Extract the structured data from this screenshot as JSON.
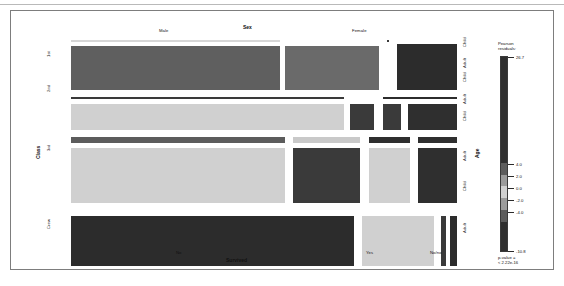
{
  "figure": {
    "type": "mosaic-plot",
    "dataset": "Titanic",
    "caption": ""
  },
  "axes": {
    "top": {
      "title": "Sex",
      "categories": [
        "Male",
        "Female"
      ]
    },
    "bottom": {
      "title": "Survived",
      "categories": [
        "No",
        "Yes",
        "No/no"
      ]
    },
    "left": {
      "title": "Class",
      "categories": [
        "1st",
        "2nd",
        "3rd",
        "Crew"
      ]
    },
    "right": {
      "title": "Age",
      "categories": [
        "Child",
        "Adult",
        "Child",
        "Adult",
        "Child",
        "Adult",
        "Child",
        "Adult"
      ]
    }
  },
  "legend": {
    "title_line1": "Pearson",
    "title_line2": "residuals:",
    "max_label": "26.7",
    "min_label": "-10.8",
    "breaks": [
      "4.0",
      "2.0",
      "0.0",
      "-2.0",
      "-4.0"
    ],
    "pvalue_line1": "p-value =",
    "pvalue_line2": "< 2.22e-16",
    "colors": {
      "very_high": "#2f2f2f",
      "high": "#5c5c5c",
      "mid_high": "#9b9b9b",
      "neutral": "#d0d0d0",
      "mid_low": "#9b9b9b",
      "low": "#5c5c5c",
      "very_low": "#2f2f2f"
    }
  },
  "chart_data": {
    "type": "heatmap",
    "title": "",
    "xlabel": "Survived",
    "ylabel": "Class",
    "grid": false,
    "legend_position": "right",
    "variables": [
      "Class",
      "Sex",
      "Age",
      "Survived"
    ],
    "shading": "Pearson residuals",
    "residual_range": [
      -10.8,
      26.7
    ],
    "residual_breaks": [
      -4.0,
      -2.0,
      0.0,
      2.0,
      4.0
    ],
    "pvalue": "< 2.22e-16",
    "tiles": [
      {
        "class": "1st",
        "sex": "Male",
        "age": "Child",
        "survived": "No",
        "fill": "#d6d6d6",
        "x": 0.5,
        "y": 0.6,
        "w": 54.0,
        "h": 1.6
      },
      {
        "class": "1st",
        "sex": "Male",
        "age": "Adult",
        "survived": "No",
        "fill": "#5f5f5f",
        "x": 0.5,
        "y": 3.0,
        "w": 54.0,
        "h": 20.0
      },
      {
        "class": "1st",
        "sex": "Male",
        "age": "Adult",
        "survived": "Yes",
        "fill": "#6a6a6a",
        "x": 55.5,
        "y": 3.0,
        "w": 24.5,
        "h": 20.0
      },
      {
        "class": "1st",
        "sex": "Female",
        "age": "Child",
        "survived": "No",
        "fill": "#3a3a3a",
        "x": 81.5,
        "y": 0.6,
        "w": 1.1,
        "h": 1.6
      },
      {
        "class": "1st",
        "sex": "Female",
        "age": "Adult",
        "survived": "Yes",
        "fill": "#2c2c2c",
        "x": 84.0,
        "y": 2.4,
        "w": 16.0,
        "h": 20.6
      },
      {
        "class": "2nd",
        "sex": "Male",
        "age": "Child",
        "survived": "Yes",
        "fill": "#3a3a3a",
        "x": 0.5,
        "y": 25.5,
        "w": 70.5,
        "h": 1.6
      },
      {
        "class": "2nd",
        "sex": "Male",
        "age": "Adult",
        "survived": "No",
        "fill": "#d0d0d0",
        "x": 0.5,
        "y": 28.2,
        "w": 70.5,
        "h": 12.5
      },
      {
        "class": "2nd",
        "sex": "Male",
        "age": "Adult",
        "survived": "Yes",
        "fill": "#3a3a3a",
        "x": 72.0,
        "y": 28.2,
        "w": 6.7,
        "h": 12.5
      },
      {
        "class": "2nd",
        "sex": "Female",
        "age": "Child",
        "survived": "Yes",
        "fill": "#2c2c2c",
        "x": 80.5,
        "y": 25.3,
        "w": 19.5,
        "h": 1.9
      },
      {
        "class": "2nd",
        "sex": "Female",
        "age": "Adult",
        "survived": "No",
        "fill": "#3a3a3a",
        "x": 80.5,
        "y": 28.2,
        "w": 5.2,
        "h": 12.5
      },
      {
        "class": "2nd",
        "sex": "Female",
        "age": "Adult",
        "survived": "Yes",
        "fill": "#2f2f2f",
        "x": 86.8,
        "y": 28.2,
        "w": 13.2,
        "h": 12.5
      },
      {
        "class": "3rd",
        "sex": "Male",
        "age": "Child",
        "survived": "No",
        "fill": "#5c5c5c",
        "x": 0.5,
        "y": 43.0,
        "w": 55.5,
        "h": 3.2
      },
      {
        "class": "3rd",
        "sex": "Male",
        "age": "Child",
        "survived": "Yes",
        "fill": "#c9c9c9",
        "x": 57.5,
        "y": 43.0,
        "w": 17.5,
        "h": 3.2
      },
      {
        "class": "3rd",
        "sex": "Male",
        "age": "Adult",
        "survived": "No",
        "fill": "#d0d0d0",
        "x": 0.5,
        "y": 47.5,
        "w": 55.5,
        "h": 25.0
      },
      {
        "class": "3rd",
        "sex": "Male",
        "age": "Adult",
        "survived": "Yes",
        "fill": "#3a3a3a",
        "x": 57.5,
        "y": 47.5,
        "w": 17.5,
        "h": 25.0
      },
      {
        "class": "3rd",
        "sex": "Female",
        "age": "Child",
        "survived": "No",
        "fill": "#2f2f2f",
        "x": 77.0,
        "y": 43.0,
        "w": 11.0,
        "h": 3.2
      },
      {
        "class": "3rd",
        "sex": "Female",
        "age": "Child",
        "survived": "Yes",
        "fill": "#2f2f2f",
        "x": 89.5,
        "y": 43.0,
        "w": 10.5,
        "h": 3.2
      },
      {
        "class": "3rd",
        "sex": "Female",
        "age": "Adult",
        "survived": "No",
        "fill": "#d0d0d0",
        "x": 77.0,
        "y": 47.5,
        "w": 11.0,
        "h": 25.0
      },
      {
        "class": "3rd",
        "sex": "Female",
        "age": "Adult",
        "survived": "Yes",
        "fill": "#2f2f2f",
        "x": 89.5,
        "y": 47.5,
        "w": 10.5,
        "h": 25.0
      },
      {
        "class": "Crew",
        "sex": "Male",
        "age": "Child",
        "survived": "No",
        "fill": "#ffffff",
        "x": 0.5,
        "y": 75.0,
        "w": 73.0,
        "h": 1.0
      },
      {
        "class": "Crew",
        "sex": "Male",
        "age": "Adult",
        "survived": "No",
        "fill": "#2c2c2c",
        "x": 0.5,
        "y": 77.5,
        "w": 73.0,
        "h": 22.5
      },
      {
        "class": "Crew",
        "sex": "Male",
        "age": "Adult",
        "survived": "Yes",
        "fill": "#d0d0d0",
        "x": 75.0,
        "y": 77.5,
        "w": 19.0,
        "h": 22.5
      },
      {
        "class": "Crew",
        "sex": "Female",
        "age": "Adult",
        "survived": "No",
        "fill": "#3a3a3a",
        "x": 95.5,
        "y": 77.5,
        "w": 1.6,
        "h": 22.5
      },
      {
        "class": "Crew",
        "sex": "Female",
        "age": "Adult",
        "survived": "Yes",
        "fill": "#2c2c2c",
        "x": 97.8,
        "y": 77.5,
        "w": 2.2,
        "h": 22.5
      }
    ]
  }
}
